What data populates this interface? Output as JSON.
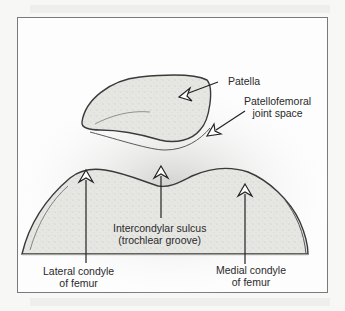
{
  "figure": {
    "labels": {
      "patella": "Patella",
      "joint_space_line1": "Patellofemoral",
      "joint_space_line2": "joint space",
      "sulcus_line1": "Intercondylar sulcus",
      "sulcus_line2": "(trochlear groove)",
      "lateral_line1": "Lateral condyle",
      "lateral_line2": "of femur",
      "medial_line1": "Medial condyle",
      "medial_line2": "of femur"
    },
    "colors": {
      "frame": "#7a7a7a",
      "ink": "#2a2a2a",
      "bone_fill": "#e4e4e2",
      "background": "#fdfdfd"
    }
  }
}
